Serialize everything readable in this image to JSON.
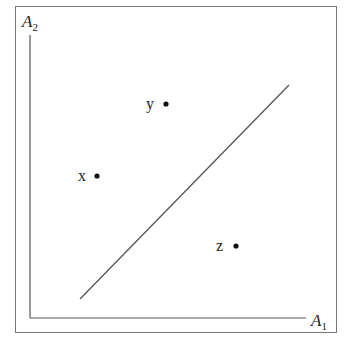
{
  "diagram": {
    "axes": {
      "x_label": "A",
      "x_subscript": "1",
      "y_label": "A",
      "y_subscript": "2"
    },
    "points": [
      {
        "label": "x",
        "cx": 97,
        "cy": 176
      },
      {
        "label": "y",
        "cx": 166,
        "cy": 104
      },
      {
        "label": "z",
        "cx": 236,
        "cy": 246
      }
    ],
    "separator_line": {
      "x1": 80,
      "y1": 299,
      "x2": 289,
      "y2": 85
    },
    "colors": {
      "frame": "#666666",
      "axis": "#555555",
      "line": "#555555",
      "point": "#111111"
    }
  }
}
